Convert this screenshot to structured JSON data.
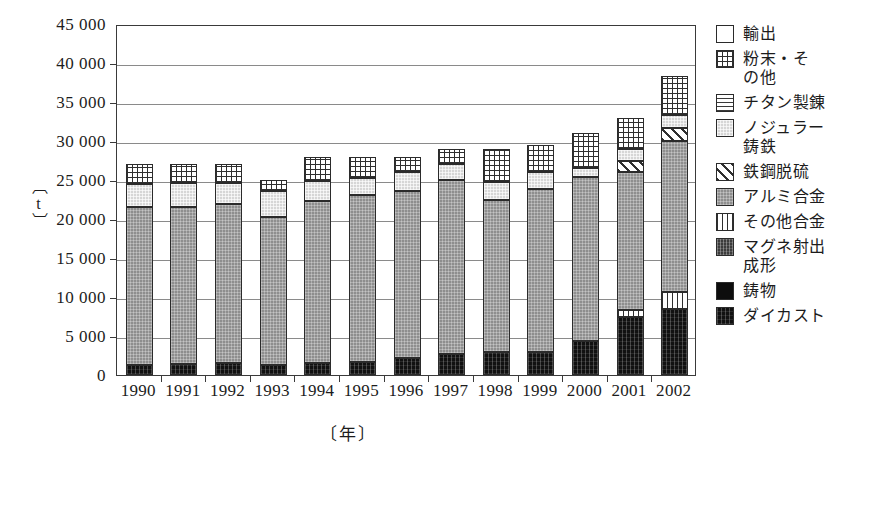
{
  "axes": {
    "y_title": "〔t〕",
    "x_title": "〔年〕",
    "y_ticks": [
      "45 000",
      "40 000",
      "35 000",
      "30 000",
      "25 000",
      "20 000",
      "15 000",
      "10 000",
      "5 000",
      "0"
    ]
  },
  "legend": {
    "items": [
      {
        "label": "輸出",
        "fill": "f-export"
      },
      {
        "label": "粉末・そ\nの他",
        "fill": "f-powder"
      },
      {
        "label": "チタン製錬",
        "fill": "f-titanium"
      },
      {
        "label": "ノジュラー\n鋳鉄",
        "fill": "f-nodular"
      },
      {
        "label": "鉄鋼脱硫",
        "fill": "f-desulf"
      },
      {
        "label": "アルミ合金",
        "fill": "f-alumi"
      },
      {
        "label": "その他合金",
        "fill": "f-otheralloy"
      },
      {
        "label": "マグネ射出\n成形",
        "fill": "f-magne"
      },
      {
        "label": "鋳物",
        "fill": "f-casting"
      },
      {
        "label": "ダイカスト",
        "fill": "f-diecast"
      }
    ]
  },
  "chart_data": {
    "type": "bar",
    "stacked": true,
    "title": "",
    "xlabel": "〔年〕",
    "ylabel": "〔t〕",
    "ylim": [
      0,
      45000
    ],
    "ytick_step": 5000,
    "grid": true,
    "legend_position": "right",
    "categories": [
      "1990",
      "1991",
      "1992",
      "1993",
      "1994",
      "1995",
      "1996",
      "1997",
      "1998",
      "1999",
      "2000",
      "2001",
      "2002"
    ],
    "series": [
      {
        "name": "ダイカスト",
        "fill": "f-diecast",
        "values": [
          1300,
          1400,
          1500,
          1300,
          1600,
          1700,
          2200,
          2700,
          2900,
          3000,
          4400,
          7400,
          8400
        ]
      },
      {
        "name": "鋳物",
        "fill": "f-casting",
        "values": [
          0,
          0,
          0,
          0,
          0,
          0,
          0,
          0,
          0,
          0,
          0,
          0,
          0
        ]
      },
      {
        "name": "マグネ射出成形",
        "fill": "f-magne",
        "values": [
          0,
          0,
          0,
          0,
          0,
          0,
          0,
          0,
          0,
          0,
          0,
          0,
          0
        ]
      },
      {
        "name": "その他合金",
        "fill": "f-otheralloy",
        "values": [
          0,
          0,
          0,
          0,
          0,
          0,
          0,
          0,
          0,
          0,
          0,
          900,
          2200
        ]
      },
      {
        "name": "アルミ合金",
        "fill": "f-alumi",
        "values": [
          20200,
          20100,
          20400,
          19000,
          20700,
          21400,
          21400,
          22300,
          19500,
          20800,
          21000,
          17700,
          19400
        ]
      },
      {
        "name": "鉄鋼脱硫",
        "fill": "f-desulf",
        "values": [
          0,
          0,
          0,
          0,
          0,
          0,
          0,
          0,
          0,
          0,
          0,
          1500,
          1700
        ]
      },
      {
        "name": "ノジュラー鋳鉄",
        "fill": "f-nodular",
        "values": [
          3000,
          3100,
          2700,
          3300,
          2600,
          2200,
          2400,
          2000,
          2400,
          2200,
          1100,
          1500,
          1600
        ]
      },
      {
        "name": "チタン製錬",
        "fill": "f-titanium",
        "values": [
          0,
          0,
          0,
          0,
          0,
          0,
          0,
          0,
          0,
          0,
          0,
          0,
          0
        ]
      },
      {
        "name": "粉末・その他",
        "fill": "f-powder",
        "values": [
          2500,
          2400,
          2400,
          1400,
          3100,
          2700,
          2000,
          2000,
          4200,
          3500,
          4500,
          4000,
          5100
        ]
      },
      {
        "name": "輸出",
        "fill": "f-export",
        "values": [
          0,
          0,
          0,
          0,
          0,
          0,
          0,
          0,
          0,
          0,
          0,
          0,
          0
        ]
      }
    ],
    "totals": [
      27000,
      27000,
      27000,
      25000,
      28000,
      28000,
      28000,
      29000,
      29000,
      29500,
      31000,
      33000,
      38400
    ]
  }
}
